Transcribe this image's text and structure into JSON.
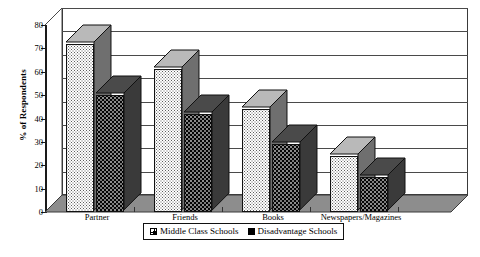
{
  "chart_data": {
    "type": "bar",
    "title": "",
    "subtitle": "",
    "xlabel": "",
    "ylabel": "% of Respondents",
    "ylim": [
      0,
      80
    ],
    "ytick_step": 10,
    "yticks": [
      "80",
      "70",
      "60",
      "50",
      "40",
      "30",
      "20",
      "10",
      "0"
    ],
    "grid": true,
    "three_d": true,
    "legend_position": "bottom-center",
    "categories": [
      "Partner",
      "Friends",
      "Books",
      "Newspapers/Magazines"
    ],
    "series": [
      {
        "name": "Middle Class Schools",
        "pattern": "light-checker",
        "values": [
          72,
          61,
          44,
          24
        ]
      },
      {
        "name": "Disadvantage Schools",
        "pattern": "black-dotted",
        "values": [
          50,
          42,
          29,
          15
        ]
      }
    ],
    "colors": {
      "series_light_fill": "#ffffff",
      "series_light_dots": "#5d5d5d",
      "series_dark_fill": "#050505",
      "series_dark_dots": "#8d8d8d",
      "side_face": "#6a6a6a",
      "dark_side_face": "#3a3a3a",
      "axis": "#1a1a1a",
      "gridline": "#4a4a4a",
      "floor": "#8a8a8a",
      "background": "#ffffff"
    }
  },
  "legend": {
    "items": [
      {
        "label": "Middle Class Schools",
        "swatch": "light-checker-swatch"
      },
      {
        "label": "Disadvantage Schools",
        "swatch": "black-swatch"
      }
    ]
  }
}
